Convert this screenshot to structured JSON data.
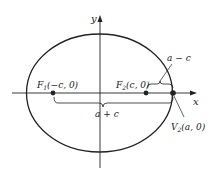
{
  "diagram": {
    "type": "ellipse-foci",
    "axes": {
      "x_label": "x",
      "y_label": "y"
    },
    "points": {
      "F1": {
        "name": "F",
        "sub": "1",
        "coords": "(−c, 0)"
      },
      "F2": {
        "name": "F",
        "sub": "2",
        "coords": "(c, 0)"
      },
      "V2": {
        "name": "V",
        "sub": "2",
        "coords": "(a, 0)"
      }
    },
    "distances": {
      "a_minus_c": "a − c",
      "a_plus_c": "a + c"
    },
    "colors": {
      "stroke": "#222222",
      "background": "#ffffff"
    }
  }
}
